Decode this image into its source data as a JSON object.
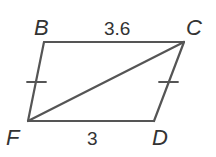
{
  "figure": {
    "type": "quadrilateral",
    "vertices": {
      "B": {
        "label": "B",
        "x": 44,
        "y": 42
      },
      "C": {
        "label": "C",
        "x": 184,
        "y": 42
      },
      "D": {
        "label": "D",
        "x": 154,
        "y": 121
      },
      "F": {
        "label": "F",
        "x": 28,
        "y": 121
      }
    },
    "segments": {
      "BC": {
        "length_label": "3.6"
      },
      "FD": {
        "length_label": "3"
      },
      "BF": {
        "tick_marks": 1
      },
      "CD": {
        "tick_marks": 1
      },
      "FC": {
        "diagonal": true
      }
    },
    "colors": {
      "stroke": "#555555",
      "text": "#333333"
    }
  }
}
